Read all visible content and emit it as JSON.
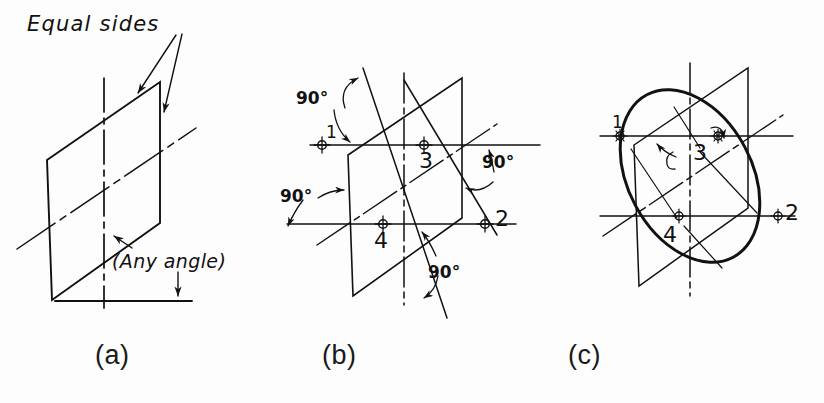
{
  "figure": {
    "background_color": "#fdfdfd",
    "ink_color": "#111111",
    "panels": [
      {
        "id": "a",
        "caption": "(a)",
        "annotations": [
          {
            "name": "equal-sides",
            "text": "Equal sides"
          },
          {
            "name": "any-angle",
            "text": "(Any angle)"
          }
        ]
      },
      {
        "id": "b",
        "caption": "(b)",
        "angle_labels": [
          "90°",
          "90°",
          "90°",
          "90°"
        ],
        "point_labels": [
          "1",
          "2",
          "3",
          "4"
        ]
      },
      {
        "id": "c",
        "caption": "(c)",
        "point_labels": [
          "1",
          "2",
          "3",
          "4"
        ]
      }
    ]
  },
  "captions": {
    "a": "(a)",
    "b": "(b)",
    "c": "(c)"
  },
  "labels": {
    "equal_sides": "Equal sides",
    "any_angle": "(Any angle)",
    "deg90_top_left": "90°",
    "deg90_mid_left": "90°",
    "deg90_right": "90°",
    "deg90_bottom": "90°",
    "b_point1": "1",
    "b_point2": "2",
    "b_point3": "3",
    "b_point4": "4",
    "c_point1": "1",
    "c_point2": "2",
    "c_point3": "3",
    "c_point4": "4"
  }
}
